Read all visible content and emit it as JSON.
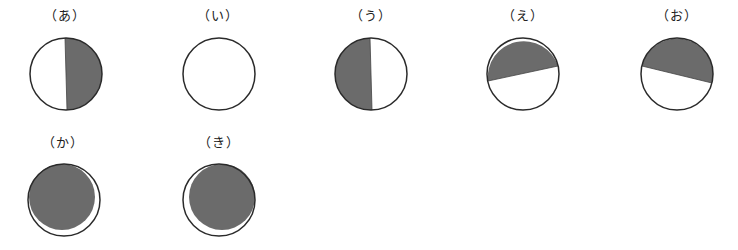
{
  "colors": {
    "shade": "#6b6b6b",
    "stroke": "#2a2a2a",
    "light": "#ffffff"
  },
  "figures": [
    {
      "label": "（あ）",
      "shape": "right-half-shaded"
    },
    {
      "label": "（い）",
      "shape": "unshaded"
    },
    {
      "label": "（う）",
      "shape": "left-half-shaded"
    },
    {
      "label": "（え）",
      "shape": "top-shaded-tilted-up-right"
    },
    {
      "label": "（お）",
      "shape": "top-shaded-tilted-down-right"
    },
    {
      "label": "（か）",
      "shape": "mostly-shaded-crescent-lower-right"
    },
    {
      "label": "（き）",
      "shape": "mostly-shaded-crescent-lower-left"
    }
  ]
}
